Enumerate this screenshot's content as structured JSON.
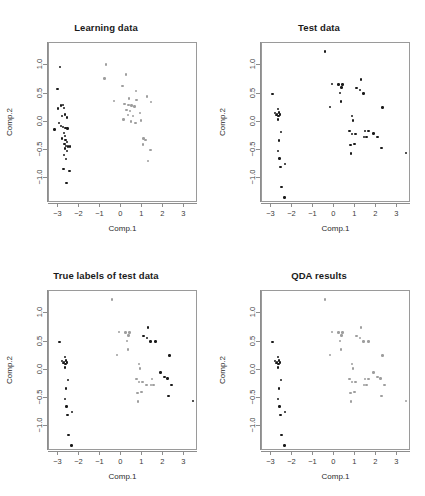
{
  "figure": {
    "background": "#ffffff",
    "point_color_class_a": "#1a1a1a",
    "point_color_class_b": "#9e9e9e",
    "frame_color": "#9a9a9a"
  },
  "axes": {
    "xlabel": "Comp.1",
    "ylabel": "Comp.2",
    "xticks": [
      "-3",
      "-2",
      "-1",
      "0",
      "1",
      "2",
      "3"
    ],
    "xtick_values": [
      -3,
      -2,
      -1,
      0,
      1,
      2,
      3
    ],
    "yticks": [
      "1.0",
      "0.5",
      "0.0",
      "-0.5",
      "-1.0"
    ],
    "ytick_values": [
      1.0,
      0.5,
      0.0,
      -0.5,
      -1.0
    ],
    "xlim": [
      -3.45,
      3.65
    ],
    "ylim": [
      -1.45,
      1.4
    ]
  },
  "panels": [
    {
      "id": "learning",
      "title": "Learning data"
    },
    {
      "id": "test",
      "title": "Test data"
    },
    {
      "id": "true",
      "title": "True labels of test data"
    },
    {
      "id": "qda",
      "title": "QDA results"
    }
  ],
  "chart_data": [
    {
      "type": "scatter",
      "title": "Learning data",
      "xlabel": "Comp.1",
      "ylabel": "Comp.2",
      "xlim": [
        -3.45,
        3.65
      ],
      "ylim": [
        -1.45,
        1.4
      ],
      "grid": false,
      "legend": "none",
      "series": [
        {
          "name": "group-1",
          "color": "#1a1a1a",
          "points": [
            [
              -2.93,
              0.97
            ],
            [
              -3.05,
              0.58
            ],
            [
              -3.18,
              -0.14
            ],
            [
              -3.02,
              0.23
            ],
            [
              -2.88,
              0.29
            ],
            [
              -2.78,
              0.3
            ],
            [
              -2.74,
              0.24
            ],
            [
              -2.84,
              0.1
            ],
            [
              -2.7,
              0.13
            ],
            [
              -2.6,
              0.07
            ],
            [
              -2.96,
              -0.03
            ],
            [
              -2.88,
              -0.08
            ],
            [
              -2.79,
              -0.1
            ],
            [
              -2.66,
              -0.11
            ],
            [
              -2.56,
              -0.12
            ],
            [
              -2.75,
              -0.2
            ],
            [
              -2.7,
              -0.26
            ],
            [
              -2.82,
              -0.3
            ],
            [
              -2.66,
              -0.33
            ],
            [
              -2.6,
              -0.36
            ],
            [
              -2.72,
              -0.4
            ],
            [
              -2.64,
              -0.43
            ],
            [
              -2.55,
              -0.44
            ],
            [
              -2.46,
              -0.44
            ],
            [
              -2.69,
              -0.48
            ],
            [
              -2.6,
              -0.52
            ],
            [
              -2.74,
              -0.6
            ],
            [
              -2.65,
              -0.67
            ],
            [
              -2.76,
              -0.84
            ],
            [
              -2.48,
              -0.88
            ],
            [
              -2.62,
              -1.09
            ]
          ]
        },
        {
          "name": "group-2",
          "color": "#9e9e9e",
          "points": [
            [
              -0.74,
              1.02
            ],
            [
              -0.8,
              0.77
            ],
            [
              0.22,
              0.84
            ],
            [
              0.05,
              0.63
            ],
            [
              0.7,
              0.55
            ],
            [
              -0.34,
              0.37
            ],
            [
              0.36,
              0.41
            ],
            [
              0.72,
              0.38
            ],
            [
              1.4,
              0.35
            ],
            [
              1.22,
              0.45
            ],
            [
              0.15,
              0.31
            ],
            [
              0.33,
              0.3
            ],
            [
              0.48,
              0.29
            ],
            [
              0.62,
              0.27
            ],
            [
              0.25,
              0.21
            ],
            [
              0.42,
              0.19
            ],
            [
              0.3,
              0.12
            ],
            [
              0.55,
              0.1
            ],
            [
              0.88,
              0.15
            ],
            [
              0.1,
              0.04
            ],
            [
              0.45,
              0.0
            ],
            [
              0.68,
              -0.02
            ],
            [
              0.92,
              0.02
            ],
            [
              1.05,
              -0.3
            ],
            [
              1.14,
              -0.33
            ],
            [
              1.02,
              -0.41
            ],
            [
              1.38,
              -0.51
            ],
            [
              1.28,
              -0.7
            ]
          ]
        }
      ]
    },
    {
      "type": "scatter",
      "title": "Test data",
      "xlabel": "Comp.1",
      "ylabel": "Comp.2",
      "xlim": [
        -3.45,
        3.65
      ],
      "ylim": [
        -1.45,
        1.4
      ],
      "grid": false,
      "legend": "none",
      "series": [
        {
          "name": "all-points",
          "color": "#1a1a1a",
          "points": [
            [
              -0.46,
              1.25
            ],
            [
              -2.95,
              0.49
            ],
            [
              -2.7,
              0.22
            ],
            [
              -2.83,
              0.15
            ],
            [
              -2.74,
              0.14
            ],
            [
              -2.63,
              0.16
            ],
            [
              -2.58,
              0.13
            ],
            [
              -2.66,
              0.1
            ],
            [
              -2.76,
              0.12
            ],
            [
              -2.7,
              0.04
            ],
            [
              -2.54,
              -0.19
            ],
            [
              -2.63,
              -0.34
            ],
            [
              -2.7,
              -0.52
            ],
            [
              -2.62,
              -0.66
            ],
            [
              -2.56,
              -0.81
            ],
            [
              -2.36,
              -0.75
            ],
            [
              -2.52,
              -1.17
            ],
            [
              -2.38,
              -1.35
            ],
            [
              -0.11,
              0.67
            ],
            [
              0.2,
              0.66
            ],
            [
              0.38,
              0.66
            ],
            [
              0.33,
              0.61
            ],
            [
              0.26,
              0.51
            ],
            [
              0.3,
              0.36
            ],
            [
              1.28,
              0.75
            ],
            [
              1.05,
              0.6
            ],
            [
              1.23,
              0.56
            ],
            [
              1.38,
              0.5
            ],
            [
              -0.2,
              0.26
            ],
            [
              2.3,
              0.25
            ],
            [
              0.85,
              0.1
            ],
            [
              0.88,
              0.02
            ],
            [
              0.72,
              -0.17
            ],
            [
              0.83,
              -0.22
            ],
            [
              1.0,
              -0.22
            ],
            [
              1.47,
              -0.17
            ],
            [
              1.63,
              -0.17
            ],
            [
              1.4,
              -0.27
            ],
            [
              1.52,
              -0.27
            ],
            [
              1.87,
              -0.21
            ],
            [
              2.05,
              -0.27
            ],
            [
              0.77,
              -0.42
            ],
            [
              0.95,
              -0.4
            ],
            [
              0.8,
              -0.57
            ],
            [
              2.25,
              -0.47
            ],
            [
              3.4,
              -0.56
            ]
          ]
        }
      ]
    },
    {
      "type": "scatter",
      "title": "True labels of test data",
      "xlabel": "Comp.1",
      "ylabel": "Comp.2",
      "xlim": [
        -3.45,
        3.65
      ],
      "ylim": [
        -1.45,
        1.4
      ],
      "grid": false,
      "legend": "none",
      "series": [
        {
          "name": "class-black",
          "color": "#1a1a1a",
          "points": [
            [
              -2.95,
              0.49
            ],
            [
              -2.7,
              0.22
            ],
            [
              -2.83,
              0.15
            ],
            [
              -2.74,
              0.14
            ],
            [
              -2.63,
              0.16
            ],
            [
              -2.58,
              0.13
            ],
            [
              -2.66,
              0.1
            ],
            [
              -2.76,
              0.12
            ],
            [
              -2.7,
              0.04
            ],
            [
              -2.54,
              -0.19
            ],
            [
              -2.63,
              -0.34
            ],
            [
              -2.7,
              -0.52
            ],
            [
              -2.62,
              -0.66
            ],
            [
              -2.56,
              -0.81
            ],
            [
              -2.36,
              -0.75
            ],
            [
              -2.52,
              -1.17
            ],
            [
              -2.38,
              -1.35
            ],
            [
              1.28,
              0.75
            ],
            [
              1.05,
              0.6
            ],
            [
              1.23,
              0.56
            ],
            [
              1.38,
              0.5
            ],
            [
              1.63,
              0.5
            ],
            [
              2.3,
              0.25
            ],
            [
              1.87,
              -0.05
            ],
            [
              2.05,
              -0.13
            ],
            [
              2.2,
              -0.16
            ],
            [
              2.38,
              -0.27
            ],
            [
              2.25,
              -0.47
            ],
            [
              3.4,
              -0.56
            ]
          ]
        },
        {
          "name": "class-gray",
          "color": "#9e9e9e",
          "points": [
            [
              -0.46,
              1.25
            ],
            [
              -0.11,
              0.67
            ],
            [
              0.2,
              0.66
            ],
            [
              0.38,
              0.66
            ],
            [
              0.33,
              0.61
            ],
            [
              0.26,
              0.51
            ],
            [
              0.3,
              0.36
            ],
            [
              -0.2,
              0.26
            ],
            [
              0.85,
              0.1
            ],
            [
              0.88,
              0.02
            ],
            [
              0.72,
              -0.17
            ],
            [
              0.83,
              -0.22
            ],
            [
              1.0,
              -0.22
            ],
            [
              1.47,
              -0.17
            ],
            [
              1.4,
              -0.27
            ],
            [
              1.52,
              -0.27
            ],
            [
              0.77,
              -0.42
            ],
            [
              0.95,
              -0.4
            ],
            [
              0.8,
              -0.57
            ],
            [
              1.2,
              -0.27
            ]
          ]
        }
      ]
    },
    {
      "type": "scatter",
      "title": "QDA results",
      "xlabel": "Comp.1",
      "ylabel": "Comp.2",
      "xlim": [
        -3.45,
        3.65
      ],
      "ylim": [
        -1.45,
        1.4
      ],
      "grid": false,
      "legend": "none",
      "series": [
        {
          "name": "pred-black",
          "color": "#1a1a1a",
          "points": [
            [
              -2.95,
              0.49
            ],
            [
              -2.7,
              0.22
            ],
            [
              -2.83,
              0.15
            ],
            [
              -2.74,
              0.14
            ],
            [
              -2.63,
              0.16
            ],
            [
              -2.58,
              0.13
            ],
            [
              -2.66,
              0.1
            ],
            [
              -2.76,
              0.12
            ],
            [
              -2.7,
              0.04
            ],
            [
              -2.54,
              -0.19
            ],
            [
              -2.63,
              -0.34
            ],
            [
              -2.7,
              -0.52
            ],
            [
              -2.62,
              -0.66
            ],
            [
              -2.56,
              -0.81
            ],
            [
              -2.36,
              -0.75
            ],
            [
              -2.52,
              -1.17
            ],
            [
              -2.38,
              -1.35
            ]
          ]
        },
        {
          "name": "pred-gray",
          "color": "#9e9e9e",
          "points": [
            [
              -0.46,
              1.25
            ],
            [
              -0.11,
              0.67
            ],
            [
              0.2,
              0.66
            ],
            [
              0.38,
              0.66
            ],
            [
              0.33,
              0.61
            ],
            [
              0.26,
              0.51
            ],
            [
              0.3,
              0.36
            ],
            [
              -0.2,
              0.26
            ],
            [
              1.28,
              0.75
            ],
            [
              1.05,
              0.6
            ],
            [
              1.23,
              0.56
            ],
            [
              1.38,
              0.5
            ],
            [
              1.63,
              0.5
            ],
            [
              2.3,
              0.25
            ],
            [
              0.85,
              0.1
            ],
            [
              0.88,
              0.02
            ],
            [
              0.72,
              -0.17
            ],
            [
              0.83,
              -0.22
            ],
            [
              1.0,
              -0.22
            ],
            [
              1.47,
              -0.17
            ],
            [
              1.63,
              -0.17
            ],
            [
              1.4,
              -0.27
            ],
            [
              1.52,
              -0.27
            ],
            [
              1.87,
              -0.05
            ],
            [
              2.05,
              -0.13
            ],
            [
              2.2,
              -0.16
            ],
            [
              2.38,
              -0.27
            ],
            [
              0.77,
              -0.42
            ],
            [
              0.95,
              -0.4
            ],
            [
              0.8,
              -0.57
            ],
            [
              2.25,
              -0.47
            ],
            [
              3.4,
              -0.56
            ]
          ]
        }
      ]
    }
  ]
}
